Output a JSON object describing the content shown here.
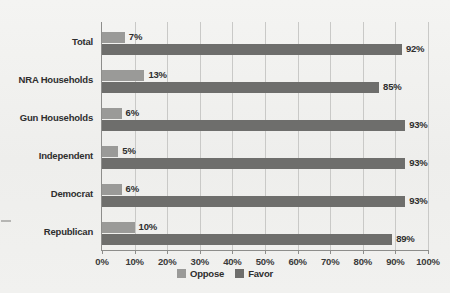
{
  "chart_data": {
    "type": "bar",
    "orientation": "horizontal",
    "title": "",
    "xlabel": "",
    "ylabel": "",
    "xlim": [
      0,
      100
    ],
    "grid": true,
    "legend_position": "bottom-center",
    "tick_labels": [
      "0%",
      "10%",
      "20%",
      "30%",
      "40%",
      "50%",
      "60%",
      "70%",
      "80%",
      "90%",
      "100%"
    ],
    "tick_values": [
      0,
      10,
      20,
      30,
      40,
      50,
      60,
      70,
      80,
      90,
      100
    ],
    "categories": [
      "Total",
      "NRA Households",
      "Gun Households",
      "Independent",
      "Democrat",
      "Republican"
    ],
    "series": [
      {
        "name": "Oppose",
        "color": "#9a9a98",
        "values": [
          7,
          13,
          6,
          5,
          6,
          10
        ],
        "labels": [
          "7%",
          "13%",
          "6%",
          "5%",
          "6%",
          "10%"
        ]
      },
      {
        "name": "Favor",
        "color": "#6e6e6c",
        "values": [
          92,
          85,
          93,
          93,
          93,
          89
        ],
        "labels": [
          "92%",
          "85%",
          "93%",
          "93%",
          "93%",
          "89%"
        ]
      }
    ]
  },
  "legend": {
    "items": [
      {
        "label": "Oppose",
        "color": "#9a9a98"
      },
      {
        "label": "Favor",
        "color": "#6e6e6c"
      }
    ]
  },
  "colors": {
    "background": "#f1f1ef",
    "axis": "#8d8d8b",
    "gridline": "#c9c9c7",
    "text": "#2e2e2e"
  }
}
